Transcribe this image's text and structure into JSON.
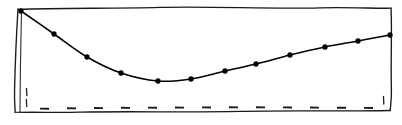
{
  "chart_data": {
    "type": "line",
    "title": "",
    "subtitle": "",
    "xlabel": "",
    "ylabel": "",
    "style": "hand-drawn-sketch",
    "grid": false,
    "legend": null,
    "legend_position": "none",
    "xlim": [
      0,
      11
    ],
    "ylim": [
      0,
      100
    ],
    "x": [
      0,
      1,
      2,
      3,
      4,
      5,
      6,
      7,
      8,
      9,
      10,
      11
    ],
    "categories": [
      "0",
      "1",
      "2",
      "3",
      "4",
      "5",
      "6",
      "7",
      "8",
      "9",
      "10",
      "11"
    ],
    "values": [
      100,
      73,
      48,
      33,
      25,
      27,
      34,
      41,
      51,
      58,
      65,
      72
    ],
    "series": [
      {
        "name": "series-1",
        "marker": "filled-circle",
        "color": "#000000",
        "values": [
          100,
          73,
          48,
          33,
          25,
          27,
          34,
          41,
          51,
          58,
          65,
          72
        ]
      }
    ],
    "points_px": [
      [
        21,
        11
      ],
      [
        54,
        34
      ],
      [
        87,
        57
      ],
      [
        121,
        73
      ],
      [
        158,
        81
      ],
      [
        191,
        79
      ],
      [
        225,
        71
      ],
      [
        256,
        64
      ],
      [
        290,
        55
      ],
      [
        325,
        47
      ],
      [
        358,
        41
      ],
      [
        390,
        35
      ]
    ],
    "annotations": [],
    "axis": {
      "y_axis_style": "double-drawn-vertical",
      "x_axis_style": "solid-baseline-with-dashed-overlay",
      "tick_count_left": 2,
      "tick_count_right": 1,
      "baseline_dash_count": 13
    },
    "colors": {
      "line": "#000000",
      "marker": "#000000",
      "frame": "#1a1a1a",
      "dash": "#1b1b1b",
      "background": "#ffffff"
    }
  }
}
